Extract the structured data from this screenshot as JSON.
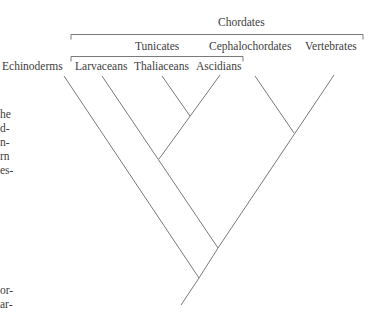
{
  "diagram": {
    "type": "cladogram",
    "group_labels": {
      "chordates": "Chordates",
      "tunicates": "Tunicates"
    },
    "taxa": [
      {
        "id": "echinoderms",
        "label": "Echinoderms"
      },
      {
        "id": "larvaceans",
        "label": "Larvaceans"
      },
      {
        "id": "thaliaceans",
        "label": "Thaliaceans"
      },
      {
        "id": "ascidians",
        "label": "Ascidians"
      },
      {
        "id": "cephalochordates",
        "label": "Cephalochordates"
      },
      {
        "id": "vertebrates",
        "label": "Vertebrates"
      }
    ],
    "topology": "(Echinoderms, ((Larvaceans, (Thaliaceans, Ascidians)), (Cephalochordates, Vertebrates)))",
    "line_color": "#7a7a7a",
    "text_color": "#3d3d3d"
  },
  "margin_text": {
    "fragments": [
      "he",
      "d-",
      "n-",
      "rn",
      "es-",
      "or-",
      "ar-"
    ]
  }
}
